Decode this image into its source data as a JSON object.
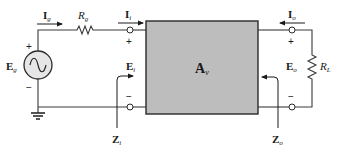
{
  "diagram": {
    "type": "two-port amplifier circuit",
    "colors": {
      "wire": "#3a3a3a",
      "block_fill": "#bdbdbd",
      "block_stroke": "#2a2a2a",
      "source_fill": "#e6e6e6"
    },
    "source": {
      "label": "E",
      "sub": "g",
      "plus": "+",
      "minus": "−",
      "symbol": "ac-sine"
    },
    "source_current": {
      "label": "I",
      "sub": "g"
    },
    "source_resistor": {
      "label": "R",
      "sub": "g"
    },
    "input_current": {
      "label": "I",
      "sub": "i"
    },
    "input_voltage": {
      "label": "E",
      "sub": "i",
      "plus": "+",
      "minus": "−"
    },
    "input_impedance": {
      "label": "Z",
      "sub": "i"
    },
    "amplifier": {
      "label": "A",
      "sub": "v"
    },
    "output_current": {
      "label": "I",
      "sub": "o"
    },
    "output_voltage": {
      "label": "E",
      "sub": "o",
      "plus": "+",
      "minus": "−"
    },
    "output_impedance": {
      "label": "Z",
      "sub": "o"
    },
    "load_resistor": {
      "label": "R",
      "sub": "L"
    }
  }
}
